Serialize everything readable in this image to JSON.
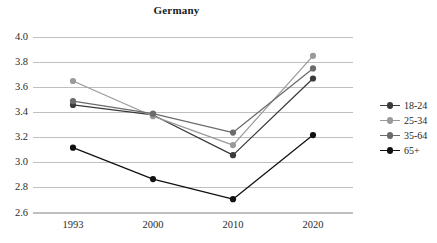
{
  "chart_data": {
    "type": "line",
    "title": "Germany",
    "xlabel": "",
    "ylabel": "",
    "categories": [
      "1993",
      "2000",
      "2010",
      "2020"
    ],
    "x": [
      1993,
      2000,
      2010,
      2020
    ],
    "series": [
      {
        "name": "18-24",
        "values": [
          3.46,
          3.38,
          3.06,
          3.67
        ],
        "color": "#3a3a3a"
      },
      {
        "name": "25-34",
        "values": [
          3.65,
          3.37,
          3.14,
          3.85
        ],
        "color": "#9a9a9a"
      },
      {
        "name": "35-64",
        "values": [
          3.49,
          3.39,
          3.24,
          3.75
        ],
        "color": "#6b6b6b"
      },
      {
        "name": "65+",
        "values": [
          3.12,
          2.87,
          2.71,
          3.22
        ],
        "color": "#111111"
      }
    ],
    "ylim": [
      2.6,
      4.0
    ],
    "yticks": [
      "2.6",
      "2.8",
      "3.0",
      "3.2",
      "3.4",
      "3.6",
      "3.8",
      "4.0"
    ],
    "ytick_values": [
      2.6,
      2.8,
      3.0,
      3.2,
      3.4,
      3.6,
      3.8,
      4.0
    ],
    "grid": true,
    "grid_color": "#bfbfbf",
    "legend_position": "right",
    "background": "#ffffff"
  },
  "legend": {
    "items": [
      {
        "label": "18-24"
      },
      {
        "label": "25-34"
      },
      {
        "label": "35-64"
      },
      {
        "label": "65+"
      }
    ]
  }
}
